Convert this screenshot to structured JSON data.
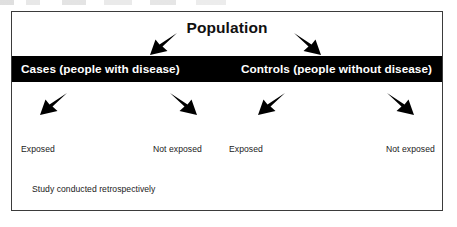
{
  "diagram": {
    "title": "Population",
    "groups": [
      {
        "id": "cases",
        "label": "Cases (people with disease)"
      },
      {
        "id": "controls",
        "label": "Controls (people without disease)"
      }
    ],
    "exposure_labels": [
      {
        "id": "cases-exposed",
        "label": "Exposed"
      },
      {
        "id": "cases-not-exposed",
        "label": "Not exposed"
      },
      {
        "id": "controls-exposed",
        "label": "Exposed"
      },
      {
        "id": "controls-not-exposed",
        "label": "Not exposed"
      }
    ],
    "footnote": "Study conducted retrospectively",
    "arrows": [
      {
        "id": "population-to-cases",
        "direction": "down-left"
      },
      {
        "id": "population-to-controls",
        "direction": "down-right"
      },
      {
        "id": "cases-to-exposed",
        "direction": "down-left"
      },
      {
        "id": "cases-to-not-exposed",
        "direction": "down-right"
      },
      {
        "id": "controls-to-exposed",
        "direction": "down-left"
      },
      {
        "id": "controls-to-not-exposed",
        "direction": "down-right"
      }
    ],
    "colors": {
      "band_background": "#000000",
      "band_text": "#ffffff",
      "frame_border": "#3b3b3b",
      "page_background": "#ffffff",
      "text": "#111111",
      "arrow": "#000000"
    }
  }
}
